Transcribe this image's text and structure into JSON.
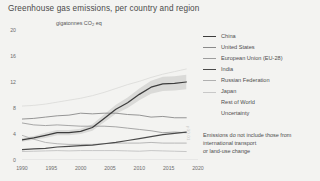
{
  "chart_data": {
    "type": "line",
    "title": "Greenhouse gas emissions, per country and region",
    "ylabel": "gigatonnes CO2 eq",
    "ylabel_main": "gigatonnes CO",
    "ylabel_sub": "2",
    "ylabel_tail": " eq",
    "xlabel": "",
    "xlim": [
      1990,
      2020
    ],
    "ylim": [
      0,
      20
    ],
    "grid": false,
    "legend_position": "right",
    "xticks": [
      "1990",
      "1995",
      "2000",
      "2005",
      "2010",
      "2015",
      "2020"
    ],
    "yticks": [
      "0",
      "4",
      "8",
      "12",
      "16",
      "20"
    ],
    "x": [
      1990,
      1992,
      1994,
      1996,
      1998,
      2000,
      2002,
      2004,
      2006,
      2008,
      2010,
      2012,
      2014,
      2016,
      2018
    ],
    "series": [
      {
        "name": "China",
        "color": "#3c3c3c",
        "width": 1.25,
        "values": [
          3.1,
          3.4,
          3.8,
          4.2,
          4.2,
          4.4,
          5.0,
          6.4,
          7.8,
          8.8,
          10.1,
          11.2,
          11.7,
          11.8,
          12.0
        ]
      },
      {
        "name": "United States",
        "color": "#8a8a8a",
        "width": 0.9,
        "values": [
          6.3,
          6.4,
          6.6,
          6.8,
          6.9,
          7.2,
          7.1,
          7.2,
          7.2,
          7.0,
          6.9,
          6.6,
          6.7,
          6.5,
          6.5
        ]
      },
      {
        "name": "European Union (EU-28)",
        "color": "#9d9d9d",
        "width": 0.9,
        "values": [
          5.7,
          5.4,
          5.3,
          5.4,
          5.3,
          5.2,
          5.2,
          5.2,
          5.1,
          4.9,
          4.7,
          4.5,
          4.2,
          4.3,
          4.2
        ]
      },
      {
        "name": "India",
        "color": "#4a4a4a",
        "width": 1.25,
        "values": [
          1.6,
          1.7,
          1.8,
          2.0,
          2.1,
          2.2,
          2.3,
          2.5,
          2.7,
          3.0,
          3.3,
          3.6,
          3.9,
          4.1,
          4.3
        ]
      },
      {
        "name": "Russian Federation",
        "color": "#b0b0b0",
        "width": 0.9,
        "values": [
          3.8,
          3.2,
          2.7,
          2.5,
          2.4,
          2.4,
          2.4,
          2.5,
          2.6,
          2.6,
          2.6,
          2.7,
          2.6,
          2.6,
          2.6
        ]
      },
      {
        "name": "Japan",
        "color": "#c2c2c2",
        "width": 0.9,
        "values": [
          1.3,
          1.35,
          1.4,
          1.45,
          1.4,
          1.45,
          1.45,
          1.45,
          1.45,
          1.4,
          1.35,
          1.45,
          1.4,
          1.35,
          1.3
        ]
      },
      {
        "name": "Rest of World",
        "color": "#dcdcda",
        "width": 0.9,
        "values": [
          8.3,
          8.4,
          8.6,
          8.9,
          9.2,
          9.5,
          9.9,
          10.4,
          11.0,
          11.6,
          12.1,
          12.7,
          13.2,
          13.6,
          14.0
        ]
      }
    ],
    "uncertainty": {
      "name": "Uncertainty",
      "color": "#dadad8",
      "around_series": "China",
      "lower": [
        2.8,
        3.1,
        3.4,
        3.8,
        3.8,
        4.0,
        4.5,
        5.8,
        7.1,
        8.0,
        9.2,
        10.2,
        10.6,
        10.7,
        10.9
      ],
      "upper": [
        3.4,
        3.7,
        4.2,
        4.6,
        4.6,
        4.8,
        5.5,
        7.0,
        8.5,
        9.6,
        11.0,
        12.2,
        12.8,
        12.9,
        13.1
      ]
    },
    "annotations": [
      "Emissions do not include those from",
      "international transport",
      "or land-use change"
    ]
  },
  "legend": {
    "items": [
      {
        "label": "China",
        "color": "#3c3c3c",
        "width": 1.4,
        "has_swatch": true
      },
      {
        "label": "United States",
        "color": "#8a8a8a",
        "width": 1.0,
        "has_swatch": true
      },
      {
        "label": "European Union (EU-28)",
        "color": "#9d9d9d",
        "width": 1.0,
        "has_swatch": true
      },
      {
        "label": "India",
        "color": "#4a4a4a",
        "width": 1.4,
        "has_swatch": true
      },
      {
        "label": "Russian Federation",
        "color": "#b0b0b0",
        "width": 1.0,
        "has_swatch": true
      },
      {
        "label": "Japan",
        "color": "#c8c8c8",
        "width": 1.0,
        "has_swatch": true
      },
      {
        "label": "Rest of World",
        "color": "#e0e0de",
        "width": 1.0,
        "has_swatch": false
      },
      {
        "label": "Uncertainty",
        "color": "#e0e0de",
        "width": 1.0,
        "has_swatch": false
      }
    ]
  },
  "watermark": {
    "text": "p30.01"
  },
  "colors": {
    "background": "#f3f3f1",
    "axis": "#cfcfcd",
    "text": "#4a4a4a"
  }
}
